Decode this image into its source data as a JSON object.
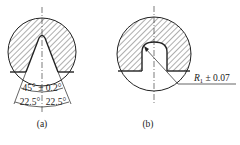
{
  "figure_a": {
    "caption": "(a)",
    "angle_total": "45° ± 0.2°",
    "angle_left": "22.5°",
    "angle_right": "22.5°"
  },
  "figure_b": {
    "caption": "(b)",
    "radius_label": "R",
    "radius_subscript": "1",
    "radius_tolerance": " ± 0.07"
  },
  "colors": {
    "line": "#222222",
    "background": "#ffffff"
  }
}
